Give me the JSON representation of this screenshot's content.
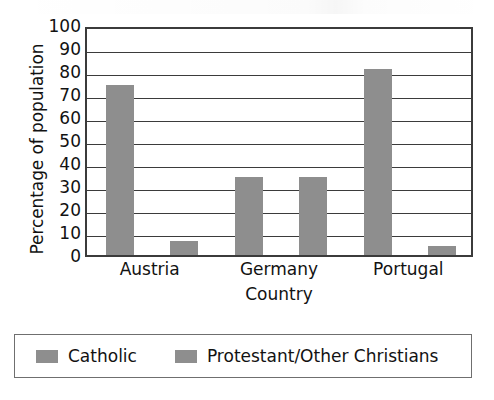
{
  "chart_data": {
    "type": "bar",
    "title": "",
    "subtitle": "",
    "xlabel": "Country",
    "ylabel": "Percentage of population",
    "categories": [
      "Austria",
      "Germany",
      "Portugal"
    ],
    "series": [
      {
        "name": "Catholic",
        "values": [
          74,
          34,
          81
        ],
        "color": "#8e8e8e"
      },
      {
        "name": "Protestant/Other Christians",
        "values": [
          6,
          34,
          4
        ],
        "color": "#8e8e8e"
      }
    ],
    "ylim": [
      0,
      100
    ],
    "ytick_labels": [
      "100",
      "90",
      "80",
      "70",
      "60",
      "50",
      "40",
      "30",
      "20",
      "10",
      "0"
    ],
    "ytick_values": [
      100,
      90,
      80,
      70,
      60,
      50,
      40,
      30,
      20,
      10,
      0
    ],
    "grid": "horizontal",
    "legend_position": "bottom",
    "legend_entries": [
      "Catholic",
      "Protestant/Other Christians"
    ],
    "axis_color": "#3b3b3b",
    "background": "#ffffff"
  }
}
